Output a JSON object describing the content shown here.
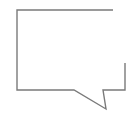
{
  "icon": {
    "name": "speech-bubble-icon",
    "label": "Speech bubble",
    "stroke_color": "#7a7a7a",
    "background_color": "#ffffff",
    "stroke_width": 1.4,
    "path_points": [
      [
        113,
        10
      ],
      [
        17,
        10
      ],
      [
        17,
        90
      ],
      [
        74,
        90
      ],
      [
        106,
        109
      ],
      [
        103,
        90
      ],
      [
        125,
        90
      ],
      [
        125,
        63
      ]
    ]
  }
}
